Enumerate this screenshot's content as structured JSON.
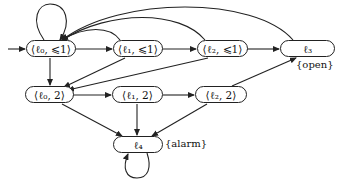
{
  "diagram": {
    "type": "state-machine",
    "nodes": [
      {
        "id": "l0_le1",
        "label": "⟨ℓ₀, ⩽1⟩",
        "initial": true
      },
      {
        "id": "l1_le1",
        "label": "⟨ℓ₁, ⩽1⟩"
      },
      {
        "id": "l2_le1",
        "label": "⟨ℓ₂, ⩽1⟩"
      },
      {
        "id": "l3",
        "label": "ℓ₃",
        "annotation": "{open}"
      },
      {
        "id": "l0_2",
        "label": "⟨ℓ₀, 2⟩"
      },
      {
        "id": "l1_2",
        "label": "⟨ℓ₁, 2⟩"
      },
      {
        "id": "l2_2",
        "label": "⟨ℓ₂, 2⟩"
      },
      {
        "id": "l4",
        "label": "ℓ₄",
        "annotation": "{alarm}"
      }
    ],
    "edges": [
      {
        "from": "l0_le1",
        "to": "l0_le1",
        "kind": "self-loop"
      },
      {
        "from": "l0_le1",
        "to": "l1_le1"
      },
      {
        "from": "l1_le1",
        "to": "l2_le1"
      },
      {
        "from": "l2_le1",
        "to": "l3"
      },
      {
        "from": "l1_le1",
        "to": "l0_le1",
        "kind": "arc"
      },
      {
        "from": "l2_le1",
        "to": "l0_le1",
        "kind": "arc"
      },
      {
        "from": "l3",
        "to": "l0_le1",
        "kind": "arc"
      },
      {
        "from": "l0_le1",
        "to": "l0_2"
      },
      {
        "from": "l1_le1",
        "to": "l0_2"
      },
      {
        "from": "l2_le1",
        "to": "l0_2"
      },
      {
        "from": "l0_2",
        "to": "l1_2"
      },
      {
        "from": "l1_2",
        "to": "l2_2"
      },
      {
        "from": "l2_2",
        "to": "l3"
      },
      {
        "from": "l0_2",
        "to": "l4"
      },
      {
        "from": "l1_2",
        "to": "l4"
      },
      {
        "from": "l2_2",
        "to": "l4"
      },
      {
        "from": "l4",
        "to": "l4",
        "kind": "self-loop"
      }
    ]
  },
  "labels": {
    "l0_le1": "⟨ℓ₀, ⩽1⟩",
    "l1_le1": "⟨ℓ₁, ⩽1⟩",
    "l2_le1": "⟨ℓ₂, ⩽1⟩",
    "l3": "ℓ₃",
    "l0_2": "⟨ℓ₀, 2⟩",
    "l1_2": "⟨ℓ₁, 2⟩",
    "l2_2": "⟨ℓ₂, 2⟩",
    "l4": "ℓ₄",
    "open": "{open}",
    "alarm": "{alarm}"
  },
  "colors": {
    "stroke": "#222222",
    "background": "#ffffff"
  }
}
